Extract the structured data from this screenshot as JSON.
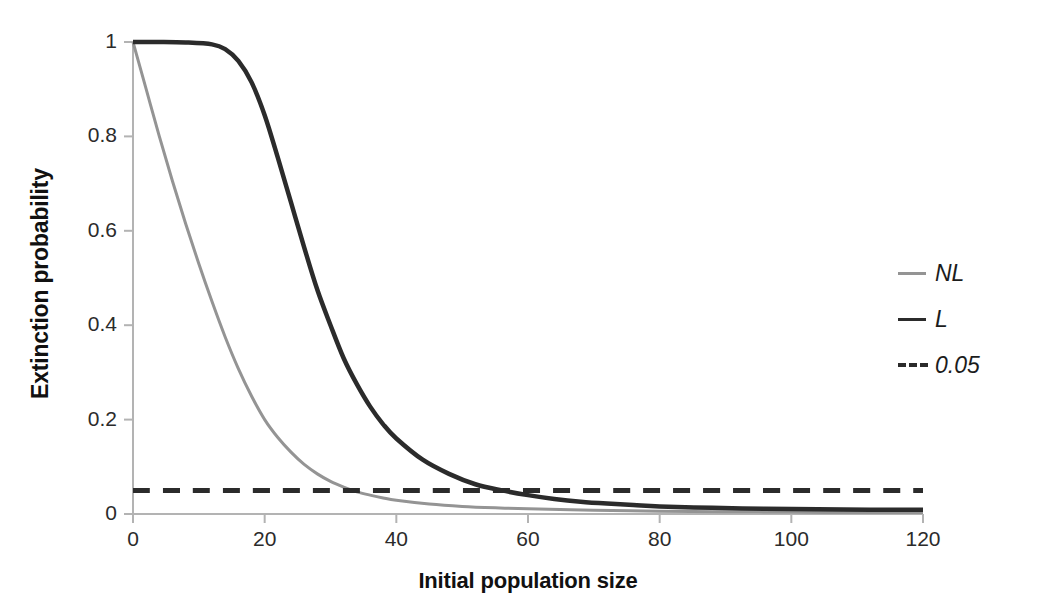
{
  "chart_data": {
    "type": "line",
    "title": "",
    "xlabel": "Initial population size",
    "ylabel": "Extinction probability",
    "xlim": [
      0,
      120
    ],
    "ylim": [
      0,
      1
    ],
    "xticks": [
      "0",
      "20",
      "40",
      "60",
      "80",
      "100",
      "120"
    ],
    "yticks": [
      "0",
      "0.2",
      "0.4",
      "0.6",
      "0.8",
      "1"
    ],
    "xtick_values": [
      0,
      20,
      40,
      60,
      80,
      100,
      120
    ],
    "ytick_values": [
      0,
      0.2,
      0.4,
      0.6,
      0.8,
      1
    ],
    "grid": false,
    "legend_position": "right",
    "series": [
      {
        "name": "NL",
        "style": "solid",
        "color": "#949494",
        "x": [
          0,
          2,
          4,
          6,
          8,
          10,
          12,
          14,
          16,
          18,
          20,
          22,
          24,
          26,
          28,
          30,
          32,
          34,
          36,
          38,
          40,
          45,
          50,
          55,
          60,
          70,
          80,
          90,
          100,
          110,
          120
        ],
        "values": [
          1.0,
          0.9,
          0.8,
          0.705,
          0.615,
          0.53,
          0.45,
          0.375,
          0.308,
          0.25,
          0.2,
          0.162,
          0.131,
          0.105,
          0.085,
          0.069,
          0.057,
          0.047,
          0.04,
          0.034,
          0.029,
          0.021,
          0.016,
          0.013,
          0.011,
          0.008,
          0.006,
          0.005,
          0.004,
          0.003,
          0.003
        ]
      },
      {
        "name": "L",
        "style": "solid",
        "color": "#2b2b2b",
        "x": [
          0,
          4,
          8,
          12,
          14,
          16,
          18,
          20,
          22,
          24,
          26,
          28,
          30,
          32,
          34,
          36,
          38,
          40,
          44,
          48,
          52,
          56,
          60,
          64,
          68,
          72,
          76,
          80,
          88,
          96,
          104,
          112,
          120
        ],
        "values": [
          1.0,
          1.0,
          0.999,
          0.995,
          0.985,
          0.96,
          0.915,
          0.845,
          0.755,
          0.66,
          0.565,
          0.475,
          0.4,
          0.33,
          0.275,
          0.228,
          0.19,
          0.16,
          0.115,
          0.085,
          0.063,
          0.05,
          0.04,
          0.032,
          0.026,
          0.022,
          0.019,
          0.016,
          0.013,
          0.011,
          0.01,
          0.009,
          0.009
        ]
      },
      {
        "name": "0.05",
        "style": "dashed",
        "color": "#2b2b2b",
        "constant_y": 0.05,
        "x": [
          0,
          120
        ],
        "values": [
          0.05,
          0.05
        ]
      }
    ],
    "annotations": {
      "nl_crosses_threshold_at_x": 27.5,
      "l_crosses_threshold_at_x": 56.5
    }
  },
  "legend": {
    "items": [
      {
        "label": "NL",
        "style": "solid",
        "color": "#949494"
      },
      {
        "label": "L",
        "style": "solid",
        "color": "#2b2b2b"
      },
      {
        "label": "0.05",
        "style": "dashed",
        "color": "#2b2b2b"
      }
    ]
  },
  "axes": {
    "axis_color": "#b3b3b3",
    "xlabel": "Initial population size",
    "ylabel": "Extinction probability",
    "xticks": [
      "0",
      "20",
      "40",
      "60",
      "80",
      "100",
      "120"
    ],
    "yticks": [
      "0",
      "0.2",
      "0.4",
      "0.6",
      "0.8",
      "1"
    ]
  }
}
